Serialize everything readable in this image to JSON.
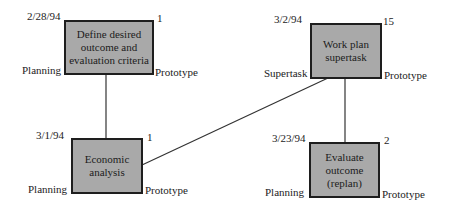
{
  "diagram": {
    "type": "task-network",
    "background": "#ffffff",
    "node_fill": "#a9a9a9",
    "node_border": "#1e1e1e",
    "line_color": "#333333",
    "nodes": [
      {
        "id": "define",
        "title": "Define desired\noutcome and\nevaluation criteria",
        "date": "2/28/94",
        "count": "1",
        "left_label": "Planning",
        "right_label": "Prototype"
      },
      {
        "id": "workplan",
        "title": "Work plan\nsupertask",
        "date": "3/2/94",
        "count": "15",
        "left_label": "Supertask",
        "right_label": "Prototype"
      },
      {
        "id": "economic",
        "title": "Economic\nanalysis",
        "date": "3/1/94",
        "count": "1",
        "left_label": "Planning",
        "right_label": "Prototype"
      },
      {
        "id": "evaluate",
        "title": "Evaluate\noutcome\n(replan)",
        "date": "3/23/94",
        "count": "2",
        "left_label": "Planning",
        "right_label": "Prototype"
      }
    ],
    "edges": [
      {
        "from": "define",
        "to": "economic"
      },
      {
        "from": "economic",
        "to": "workplan"
      },
      {
        "from": "workplan",
        "to": "evaluate"
      }
    ]
  }
}
